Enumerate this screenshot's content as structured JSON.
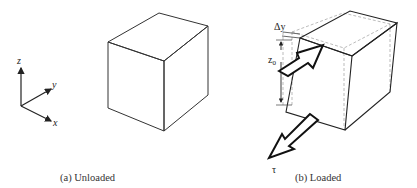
{
  "axes": {
    "z_label": "z",
    "y_label": "y",
    "x_label": "x"
  },
  "panel_a": {
    "caption": "(a) Unloaded"
  },
  "panel_b": {
    "caption": "(b) Loaded",
    "delta_y_label": "Δy",
    "z0_label": "z",
    "z0_subscript": "0",
    "tau_label": "τ"
  },
  "colors": {
    "line": "#222222",
    "dashed": "#aaaaaa",
    "background": "#ffffff"
  }
}
